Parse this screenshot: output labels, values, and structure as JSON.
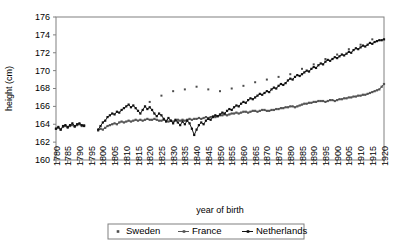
{
  "chart_data": {
    "type": "line",
    "title": "",
    "xlabel": "year of birth",
    "ylabel": "height (cm)",
    "xlim": [
      1780,
      1920
    ],
    "ylim": [
      160,
      176
    ],
    "ytick_step": 2,
    "xtick_step": 5,
    "grid": false,
    "legend_position": "bottom",
    "xticks": [
      1780,
      1785,
      1790,
      1795,
      1800,
      1805,
      1810,
      1815,
      1820,
      1825,
      1830,
      1835,
      1840,
      1845,
      1850,
      1855,
      1860,
      1865,
      1870,
      1875,
      1880,
      1885,
      1890,
      1895,
      1900,
      1905,
      1910,
      1915,
      1920
    ],
    "yticks": [
      160,
      162,
      164,
      166,
      168,
      170,
      172,
      174,
      176
    ],
    "series": [
      {
        "name": "Sweden",
        "marker": "dot",
        "style": "markers-only",
        "color": "#4d4d4d",
        "x": [
          1820,
          1825,
          1830,
          1835,
          1840,
          1845,
          1850,
          1855,
          1860,
          1865,
          1870,
          1875,
          1880,
          1885,
          1890,
          1895,
          1900,
          1905,
          1910,
          1915
        ],
        "values": [
          166.5,
          167.2,
          167.7,
          167.9,
          168.2,
          167.9,
          167.7,
          168.0,
          168.3,
          168.7,
          169.0,
          169.3,
          169.6,
          170.2,
          170.7,
          171.3,
          171.8,
          172.4,
          172.9,
          173.5
        ]
      },
      {
        "name": "France",
        "marker": "square",
        "style": "line-markers",
        "color": "#555555",
        "x": [
          1780,
          1781,
          1782,
          1783,
          1784,
          1785,
          1786,
          1787,
          1788,
          1789,
          1790,
          1791,
          1792,
          1798,
          1799,
          1800,
          1801,
          1802,
          1803,
          1804,
          1805,
          1806,
          1807,
          1808,
          1809,
          1810,
          1811,
          1812,
          1813,
          1814,
          1815,
          1816,
          1817,
          1818,
          1819,
          1820,
          1821,
          1822,
          1823,
          1824,
          1825,
          1826,
          1827,
          1828,
          1829,
          1830,
          1831,
          1832,
          1833,
          1834,
          1835,
          1836,
          1837,
          1838,
          1839,
          1840,
          1841,
          1842,
          1843,
          1844,
          1845,
          1846,
          1847,
          1848,
          1849,
          1850,
          1851,
          1852,
          1853,
          1854,
          1855,
          1856,
          1857,
          1858,
          1859,
          1860,
          1861,
          1862,
          1863,
          1864,
          1865,
          1866,
          1867,
          1868,
          1869,
          1870,
          1871,
          1872,
          1873,
          1874,
          1875,
          1876,
          1877,
          1878,
          1879,
          1880,
          1881,
          1882,
          1883,
          1884,
          1885,
          1886,
          1887,
          1888,
          1889,
          1890,
          1891,
          1892,
          1893,
          1894,
          1895,
          1896,
          1897,
          1898,
          1899,
          1900,
          1901,
          1902,
          1903,
          1904,
          1905,
          1906,
          1907,
          1908,
          1909,
          1910,
          1911,
          1912,
          1913,
          1914,
          1915,
          1916,
          1917,
          1918,
          1919,
          1920
        ],
        "values": [
          163.5,
          163.6,
          163.4,
          163.7,
          163.8,
          163.6,
          163.8,
          163.9,
          163.7,
          163.9,
          164.0,
          163.8,
          163.9,
          163.3,
          163.5,
          163.4,
          163.6,
          163.8,
          163.9,
          164.0,
          164.1,
          164.0,
          164.2,
          164.3,
          164.2,
          164.3,
          164.4,
          164.3,
          164.4,
          164.5,
          164.4,
          164.5,
          164.4,
          164.5,
          164.6,
          164.5,
          164.5,
          164.6,
          164.5,
          164.4,
          164.4,
          164.5,
          164.4,
          164.3,
          164.4,
          164.3,
          164.4,
          164.5,
          164.4,
          164.5,
          164.4,
          164.5,
          164.6,
          164.5,
          164.6,
          164.6,
          164.7,
          164.6,
          164.7,
          164.8,
          164.7,
          164.8,
          164.9,
          164.8,
          164.9,
          165.0,
          165.0,
          165.1,
          165.0,
          165.1,
          165.2,
          165.2,
          165.3,
          165.2,
          165.3,
          165.4,
          165.4,
          165.3,
          165.4,
          165.5,
          165.5,
          165.4,
          165.5,
          165.6,
          165.6,
          165.5,
          165.5,
          165.6,
          165.6,
          165.7,
          165.7,
          165.8,
          165.8,
          165.9,
          165.9,
          166.0,
          166.0,
          165.9,
          166.0,
          166.1,
          166.2,
          166.3,
          166.3,
          166.4,
          166.4,
          166.5,
          166.5,
          166.6,
          166.6,
          166.6,
          166.5,
          166.6,
          166.7,
          166.7,
          166.6,
          166.7,
          166.8,
          166.8,
          166.9,
          166.9,
          167.0,
          167.0,
          167.1,
          167.1,
          167.2,
          167.2,
          167.3,
          167.3,
          167.4,
          167.5,
          167.6,
          167.7,
          167.8,
          167.9,
          168.2,
          168.5
        ]
      },
      {
        "name": "Netherlands",
        "marker": "triangle",
        "style": "line-markers",
        "color": "#111111",
        "x": [
          1780,
          1781,
          1782,
          1783,
          1784,
          1785,
          1786,
          1787,
          1788,
          1789,
          1790,
          1791,
          1792,
          1798,
          1799,
          1800,
          1801,
          1802,
          1803,
          1804,
          1805,
          1806,
          1807,
          1808,
          1809,
          1810,
          1811,
          1812,
          1813,
          1814,
          1815,
          1816,
          1817,
          1818,
          1819,
          1820,
          1821,
          1822,
          1823,
          1824,
          1825,
          1826,
          1827,
          1828,
          1829,
          1830,
          1831,
          1832,
          1833,
          1834,
          1835,
          1836,
          1837,
          1838,
          1839,
          1840,
          1841,
          1842,
          1843,
          1844,
          1845,
          1846,
          1847,
          1848,
          1849,
          1850,
          1851,
          1852,
          1853,
          1854,
          1855,
          1856,
          1857,
          1858,
          1859,
          1860,
          1861,
          1862,
          1863,
          1864,
          1865,
          1866,
          1867,
          1868,
          1869,
          1870,
          1871,
          1872,
          1873,
          1874,
          1875,
          1876,
          1877,
          1878,
          1879,
          1880,
          1881,
          1882,
          1883,
          1884,
          1885,
          1886,
          1887,
          1888,
          1889,
          1890,
          1891,
          1892,
          1893,
          1894,
          1895,
          1896,
          1897,
          1898,
          1899,
          1900,
          1901,
          1902,
          1903,
          1904,
          1905,
          1906,
          1907,
          1908,
          1909,
          1910,
          1911,
          1912,
          1913,
          1914,
          1915,
          1916,
          1917,
          1918,
          1919,
          1920
        ],
        "values": [
          163.5,
          163.7,
          163.4,
          163.8,
          163.9,
          163.7,
          163.9,
          164.1,
          163.8,
          164.0,
          164.1,
          163.9,
          163.8,
          163.4,
          163.8,
          164.2,
          164.4,
          164.8,
          165.0,
          165.2,
          165.1,
          165.4,
          165.3,
          165.6,
          165.8,
          166.0,
          166.2,
          165.9,
          166.1,
          165.8,
          165.5,
          165.2,
          165.6,
          166.0,
          165.7,
          165.9,
          165.6,
          165.2,
          164.9,
          165.2,
          165.0,
          164.6,
          164.3,
          164.7,
          164.4,
          164.1,
          164.5,
          164.2,
          163.9,
          164.3,
          164.0,
          164.4,
          164.1,
          163.5,
          162.8,
          163.4,
          163.9,
          164.2,
          164.0,
          164.4,
          164.6,
          164.5,
          164.8,
          165.0,
          164.9,
          165.1,
          165.3,
          165.2,
          165.5,
          165.7,
          165.6,
          165.9,
          166.1,
          166.0,
          166.3,
          166.5,
          166.4,
          166.7,
          166.9,
          166.8,
          167.0,
          167.2,
          167.4,
          167.3,
          167.5,
          167.7,
          167.6,
          167.9,
          168.1,
          168.0,
          168.3,
          168.5,
          168.4,
          168.6,
          168.9,
          169.1,
          169.0,
          169.3,
          169.5,
          169.4,
          169.6,
          169.8,
          170.0,
          169.9,
          170.2,
          170.4,
          170.3,
          170.6,
          170.8,
          170.7,
          171.0,
          171.2,
          171.1,
          171.3,
          171.5,
          171.4,
          171.6,
          171.8,
          171.7,
          171.9,
          172.1,
          172.0,
          172.3,
          172.5,
          172.4,
          172.6,
          172.8,
          172.7,
          172.9,
          173.1,
          173.0,
          173.2,
          173.3,
          173.4,
          173.4,
          173.5
        ]
      }
    ]
  },
  "legend": {
    "items": [
      {
        "label": "Sweden"
      },
      {
        "label": "France"
      },
      {
        "label": "Netherlands"
      }
    ]
  }
}
